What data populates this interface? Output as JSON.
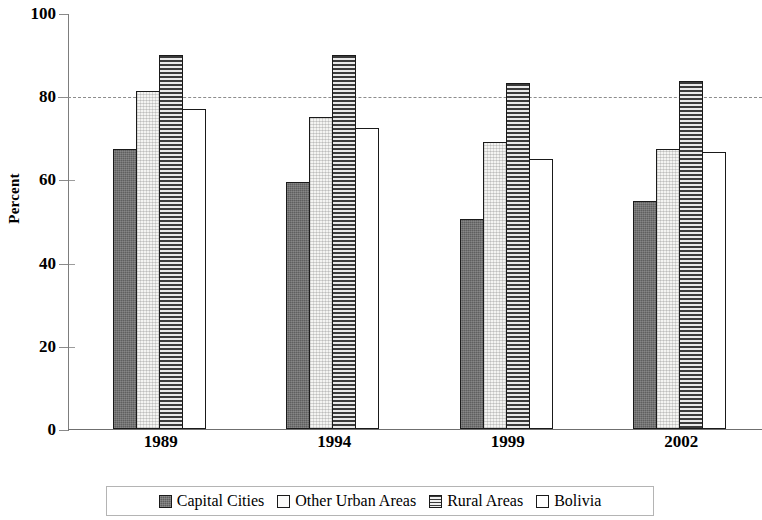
{
  "chart_data": {
    "type": "bar",
    "title": "",
    "xlabel": "",
    "ylabel": "Percent",
    "categories": [
      "1989",
      "1994",
      "1999",
      "2002"
    ],
    "series": [
      {
        "name": "Capital Cities",
        "values": [
          67.3,
          59.3,
          50.6,
          54.8
        ]
      },
      {
        "name": "Other Urban Areas",
        "values": [
          81.2,
          75.1,
          68.9,
          67.2
        ]
      },
      {
        "name": "Rural Areas",
        "values": [
          89.8,
          89.8,
          83.2,
          83.7
        ]
      },
      {
        "name": "Bolivia",
        "values": [
          77.0,
          72.3,
          64.8,
          66.7
        ]
      }
    ],
    "ylim": [
      0,
      100
    ],
    "y_ticks": [
      0,
      20,
      40,
      60,
      80,
      100
    ],
    "y_tick_labels": [
      "0",
      "20",
      "40",
      "60",
      "80",
      "100"
    ],
    "gridlines": {
      "dashed_at": [
        80
      ],
      "grid_on": false
    },
    "legend_position": "bottom",
    "bar_fill_patterns": [
      "dark-solid",
      "light-speckle",
      "horizontal-lines",
      "white"
    ]
  },
  "axis": {
    "y_title": "Percent"
  },
  "legend": {
    "items": [
      {
        "label": "Capital Cities"
      },
      {
        "label": "Other Urban Areas"
      },
      {
        "label": "Rural Areas"
      },
      {
        "label": "Bolivia"
      }
    ]
  }
}
